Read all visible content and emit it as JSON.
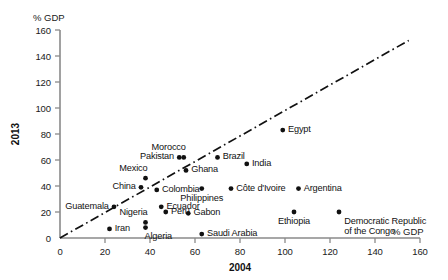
{
  "chart_data": {
    "type": "scatter",
    "title": "",
    "xlabel": "2004",
    "ylabel": "2013",
    "x_unit_label": "% GDP",
    "y_unit_label": "% GDP",
    "xlim": [
      0,
      160
    ],
    "ylim": [
      0,
      160
    ],
    "x_ticks": [
      0,
      20,
      40,
      60,
      80,
      100,
      120,
      140,
      160
    ],
    "y_ticks": [
      0,
      20,
      40,
      60,
      80,
      100,
      120,
      140,
      160
    ],
    "grid": false,
    "legend": "none",
    "annotations": [
      {
        "name": "identity-trend-line",
        "type": "dash-dot line",
        "from": [
          0,
          0
        ],
        "to": [
          155,
          152
        ]
      }
    ],
    "points": [
      {
        "label": "Iran",
        "x": 22,
        "y": 7,
        "label_pos": "right"
      },
      {
        "label": "Guatemala",
        "x": 24,
        "y": 24,
        "label_pos": "left"
      },
      {
        "label": "China",
        "x": 36,
        "y": 39,
        "label_pos": "left"
      },
      {
        "label": "Mexico",
        "x": 38,
        "y": 46,
        "label_pos": "above-left"
      },
      {
        "label": "Nigeria",
        "x": 38,
        "y": 12,
        "label_pos": "above-left"
      },
      {
        "label": "Algeria",
        "x": 38,
        "y": 8,
        "label_pos": "below-right"
      },
      {
        "label": "Colombia",
        "x": 43,
        "y": 37,
        "label_pos": "right"
      },
      {
        "label": "Ecuador",
        "x": 45,
        "y": 24,
        "label_pos": "right"
      },
      {
        "label": "Peru",
        "x": 47,
        "y": 20,
        "label_pos": "right"
      },
      {
        "label": "Pakistan",
        "x": 53,
        "y": 62,
        "label_pos": "left"
      },
      {
        "label": "Morocco",
        "x": 55,
        "y": 62,
        "label_pos": "above-left"
      },
      {
        "label": "Ghana",
        "x": 56,
        "y": 52,
        "label_pos": "right"
      },
      {
        "label": "Gabon",
        "x": 57,
        "y": 19,
        "label_pos": "right"
      },
      {
        "label": "Philippines",
        "x": 63,
        "y": 38,
        "label_pos": "below"
      },
      {
        "label": "Saudi Arabia",
        "x": 63,
        "y": 3,
        "label_pos": "right"
      },
      {
        "label": "Brazil",
        "x": 70,
        "y": 62,
        "label_pos": "right"
      },
      {
        "label": "Côte d'Ivoire",
        "x": 76,
        "y": 38,
        "label_pos": "right"
      },
      {
        "label": "India",
        "x": 83,
        "y": 57,
        "label_pos": "right"
      },
      {
        "label": "Egypt",
        "x": 99,
        "y": 83,
        "label_pos": "right"
      },
      {
        "label": "Ethiopia",
        "x": 104,
        "y": 20,
        "label_pos": "below"
      },
      {
        "label": "Argentina",
        "x": 106,
        "y": 38,
        "label_pos": "right"
      },
      {
        "label": "Democratic Republic of the Congo",
        "x": 124,
        "y": 20,
        "label_pos": "right",
        "label_lines": [
          "Democratic Republic",
          "of the Congo"
        ]
      }
    ],
    "colors": {
      "marker": "#111111",
      "axis": "#8a8a8a",
      "trend": "#111111",
      "text": "#111111",
      "background": "#ffffff"
    }
  }
}
